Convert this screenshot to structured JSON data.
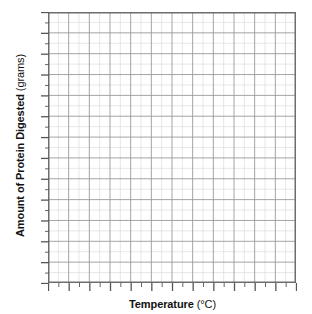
{
  "chart_data": {
    "type": "line",
    "title": "",
    "subtitle": "",
    "xlabel": "Temperature (°C)",
    "xlabel_main": "Temperature",
    "xlabel_unit": "(°C)",
    "ylabel": "Amount of Protein Digested (grams)",
    "ylabel_main": "Amount of Protein Digested",
    "ylabel_unit": "(grams)",
    "series": [],
    "categories": [],
    "values": [],
    "annotations": [],
    "legend": [],
    "legend_position": "none",
    "grid": true,
    "grid_style": "graph-paper",
    "xtick_labels": [],
    "ytick_labels": [],
    "x_major_ticks": 12,
    "x_minor_ticks": 24,
    "y_major_ticks": 13,
    "y_minor_ticks": 26,
    "grid_columns": 24,
    "grid_rows": 26,
    "major_every_cells": 2,
    "state": "blank grid, no data plotted",
    "colors": {
      "axis": "#555555",
      "grid_major": "#9a9a9a",
      "grid_minor": "#dcdcdc",
      "text": "#111111",
      "background": "#ffffff"
    }
  }
}
